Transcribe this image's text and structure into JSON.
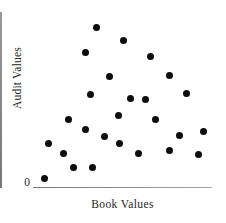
{
  "chart_data": {
    "type": "scatter",
    "title": "",
    "xlabel": "Book Values",
    "ylabel": "Audit Values",
    "origin_label": "0",
    "xlim": [
      0,
      100
    ],
    "ylim": [
      0,
      100
    ],
    "grid": false,
    "legend": null,
    "marker": {
      "shape": "circle",
      "color": "#0d0d0d",
      "size_px": 7
    },
    "axis_color": "#8d8d8d",
    "n_points": 26,
    "points": [
      {
        "x": 35.2,
        "y": 91.4
      },
      {
        "x": 50.3,
        "y": 84.0
      },
      {
        "x": 29.1,
        "y": 76.6
      },
      {
        "x": 65.4,
        "y": 74.3
      },
      {
        "x": 43.0,
        "y": 62.9
      },
      {
        "x": 76.0,
        "y": 64.0
      },
      {
        "x": 32.4,
        "y": 53.1
      },
      {
        "x": 54.7,
        "y": 50.3
      },
      {
        "x": 85.5,
        "y": 53.7
      },
      {
        "x": 62.6,
        "y": 50.0
      },
      {
        "x": 47.5,
        "y": 41.1
      },
      {
        "x": 20.1,
        "y": 38.3
      },
      {
        "x": 68.7,
        "y": 38.3
      },
      {
        "x": 29.6,
        "y": 32.6
      },
      {
        "x": 82.1,
        "y": 29.7
      },
      {
        "x": 95.5,
        "y": 32.0
      },
      {
        "x": 40.2,
        "y": 29.1
      },
      {
        "x": 48.6,
        "y": 25.1
      },
      {
        "x": 8.4,
        "y": 24.6
      },
      {
        "x": 76.5,
        "y": 20.6
      },
      {
        "x": 59.2,
        "y": 19.4
      },
      {
        "x": 17.3,
        "y": 18.9
      },
      {
        "x": 92.7,
        "y": 18.3
      },
      {
        "x": 22.9,
        "y": 11.4
      },
      {
        "x": 33.0,
        "y": 11.4
      },
      {
        "x": 6.7,
        "y": 5.1
      }
    ]
  }
}
